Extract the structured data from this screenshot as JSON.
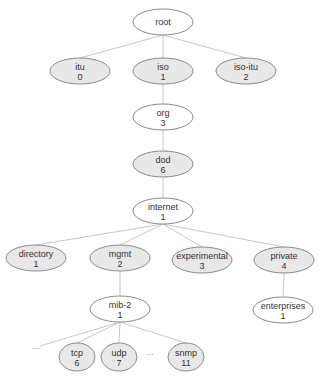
{
  "diagram": {
    "title": "",
    "colors": {
      "filled": "#e8e8e8",
      "unfilled": "#ffffff",
      "stroke": "#8a8a8a",
      "edge": "#c8c8c8",
      "text": "#333333"
    },
    "nodes": [
      {
        "id": "root",
        "name": "root",
        "number": "",
        "x": 163,
        "y": 22,
        "rx": 30,
        "ry": 13,
        "filled": false
      },
      {
        "id": "itu",
        "name": "itu",
        "number": "0",
        "x": 80,
        "y": 71,
        "rx": 30,
        "ry": 13,
        "filled": true
      },
      {
        "id": "iso",
        "name": "iso",
        "number": "1",
        "x": 163,
        "y": 71,
        "rx": 30,
        "ry": 13,
        "filled": true
      },
      {
        "id": "iso-itu",
        "name": "iso-itu",
        "number": "2",
        "x": 246,
        "y": 71,
        "rx": 30,
        "ry": 13,
        "filled": true
      },
      {
        "id": "org",
        "name": "org",
        "number": "3",
        "x": 163,
        "y": 117,
        "rx": 30,
        "ry": 13,
        "filled": false
      },
      {
        "id": "dod",
        "name": "dod",
        "number": "6",
        "x": 163,
        "y": 164,
        "rx": 30,
        "ry": 13,
        "filled": true
      },
      {
        "id": "internet",
        "name": "internet",
        "number": "1",
        "x": 163,
        "y": 211,
        "rx": 30,
        "ry": 13,
        "filled": false
      },
      {
        "id": "directory",
        "name": "directory",
        "number": "1",
        "x": 36,
        "y": 258,
        "rx": 30,
        "ry": 13,
        "filled": true
      },
      {
        "id": "mgmt",
        "name": "mgmt",
        "number": "2",
        "x": 120,
        "y": 258,
        "rx": 30,
        "ry": 13,
        "filled": true
      },
      {
        "id": "experimental",
        "name": "experimental",
        "number": "3",
        "x": 202,
        "y": 260,
        "rx": 30,
        "ry": 13,
        "filled": true
      },
      {
        "id": "private",
        "name": "private",
        "number": "4",
        "x": 284,
        "y": 260,
        "rx": 30,
        "ry": 13,
        "filled": true
      },
      {
        "id": "mib-2",
        "name": "mib-2",
        "number": "1",
        "x": 120,
        "y": 309,
        "rx": 30,
        "ry": 13,
        "filled": false
      },
      {
        "id": "enterprises",
        "name": "enterprises",
        "number": "1",
        "x": 283,
        "y": 310,
        "rx": 30,
        "ry": 13,
        "filled": false
      },
      {
        "id": "tcp",
        "name": "tcp",
        "number": "6",
        "x": 77,
        "y": 357,
        "rx": 18,
        "ry": 14,
        "filled": true
      },
      {
        "id": "udp",
        "name": "udp",
        "number": "7",
        "x": 119,
        "y": 357,
        "rx": 18,
        "ry": 14,
        "filled": true
      },
      {
        "id": "snmp",
        "name": "snmp",
        "number": "11",
        "x": 186,
        "y": 357,
        "rx": 18,
        "ry": 14,
        "filled": true
      }
    ],
    "edges": [
      {
        "from": "root",
        "to": "itu"
      },
      {
        "from": "root",
        "to": "iso"
      },
      {
        "from": "root",
        "to": "iso-itu"
      },
      {
        "from": "iso",
        "to": "org"
      },
      {
        "from": "org",
        "to": "dod"
      },
      {
        "from": "dod",
        "to": "internet"
      },
      {
        "from": "internet",
        "to": "directory"
      },
      {
        "from": "internet",
        "to": "mgmt"
      },
      {
        "from": "internet",
        "to": "experimental"
      },
      {
        "from": "internet",
        "to": "private"
      },
      {
        "from": "mgmt",
        "to": "mib-2"
      },
      {
        "from": "private",
        "to": "enterprises"
      },
      {
        "from": "mib-2",
        "to": "tcp"
      },
      {
        "from": "mib-2",
        "to": "udp"
      },
      {
        "from": "mib-2",
        "to": "snmp"
      }
    ],
    "extra_edges": [
      {
        "from": "mib-2",
        "x2": 40,
        "y2": 346
      }
    ],
    "ellipses": [
      {
        "label": "...",
        "x": 36,
        "y": 349
      },
      {
        "label": "...",
        "x": 150,
        "y": 355
      }
    ]
  }
}
